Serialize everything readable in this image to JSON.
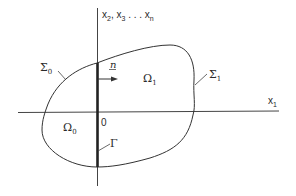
{
  "diagram": {
    "axes": {
      "vertical_label": "x",
      "vertical_subs": [
        "2",
        "3",
        "n"
      ],
      "vertical_sep": ", ",
      "vertical_ellipsis": " . . . ",
      "horizontal_label": "x",
      "horizontal_sub": "1",
      "origin_label": "0"
    },
    "regions": {
      "omega0": {
        "symbol": "Ω",
        "sub": "0"
      },
      "omega1": {
        "symbol": "Ω",
        "sub": "1"
      }
    },
    "boundaries": {
      "sigma0": {
        "symbol": "Σ",
        "sub": "0"
      },
      "sigma1": {
        "symbol": "Σ",
        "sub": "1"
      },
      "gamma": {
        "symbol": "Γ"
      }
    },
    "normal_vector": {
      "label": "n"
    },
    "colors": {
      "line": "#333333",
      "background": "#ffffff"
    }
  }
}
